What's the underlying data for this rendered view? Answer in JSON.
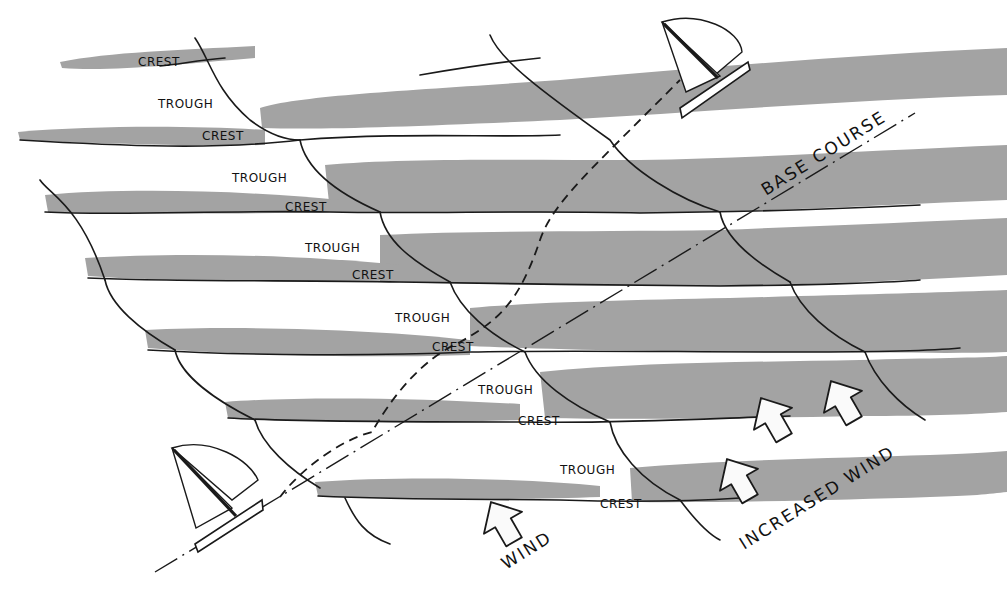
{
  "figure": {
    "type": "diagram",
    "colors": {
      "wave_band": "#a3a3a3",
      "ink": "#1a1a1a",
      "background": "#ffffff"
    }
  },
  "labels": {
    "crests": [
      "CREST",
      "CREST",
      "CREST",
      "CREST",
      "CREST",
      "CREST",
      "CREST"
    ],
    "troughs": [
      "TROUGH",
      "TROUGH",
      "TROUGH",
      "TROUGH",
      "TROUGH",
      "TROUGH"
    ],
    "base_course": "BASE COURSE",
    "wind": "WIND",
    "increased_wind": "INCREASED WIND"
  },
  "elements": {
    "boats": [
      "sailboat-start",
      "sailboat-end"
    ],
    "arrows": [
      "wind-arrow",
      "increased-wind-arrow-1",
      "increased-wind-arrow-2",
      "increased-wind-arrow-3"
    ],
    "paths": [
      "base-course-line",
      "actual-course-dashed"
    ]
  }
}
